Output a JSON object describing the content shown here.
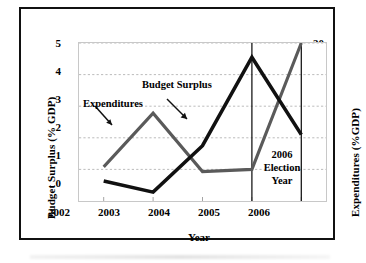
{
  "chart_data": {
    "type": "line",
    "title": "",
    "xlabel": "Year",
    "ylabel": "Budget Surplus (% GDP)",
    "y2label": "Expenditures (%GDP)",
    "categories": [
      "2002",
      "2003",
      "2004",
      "2005",
      "2006"
    ],
    "x_ticks": [
      "2002",
      "2003",
      "2004",
      "2005",
      "2006"
    ],
    "y_ticks": [
      "0",
      "1",
      "2",
      "3",
      "4",
      "5"
    ],
    "y2_ticks": [
      "25",
      "26",
      "27",
      "28",
      "29",
      "30"
    ],
    "ylim": [
      0,
      5
    ],
    "y2lim": [
      25,
      30
    ],
    "grid": true,
    "legend": "annotations",
    "series": [
      {
        "name": "Budget Surplus",
        "axis": "left",
        "unit": "% GDP",
        "color": "#111111",
        "values": [
          0.63,
          0.28,
          1.75,
          4.55,
          2.1
        ]
      },
      {
        "name": "Expenditures",
        "axis": "right",
        "unit": "%GDP",
        "color": "#5a5a5a",
        "values": [
          26.08,
          27.78,
          25.93,
          26.0,
          30.0
        ],
        "values_left_scale": [
          1.08,
          2.78,
          0.93,
          1.0,
          5.0
        ]
      }
    ],
    "annotations": [
      {
        "name": "expenditures-label",
        "text": "Expenditures",
        "points_to": "Expenditures"
      },
      {
        "name": "budget-surplus-label",
        "text": "Budget Surplus",
        "points_to": "Budget Surplus"
      },
      {
        "name": "election-year-note",
        "lines": [
          "2006",
          "Election",
          "Year"
        ],
        "text": "2006 Election Year"
      }
    ],
    "vertical_markers": [
      {
        "name": "election-line-2005",
        "x": "2005",
        "color": "#111111"
      },
      {
        "name": "election-line-2006",
        "x": "2006",
        "color": "#111111"
      }
    ]
  },
  "axes": {
    "left": {
      "title": "Budget Surplus (% GDP)",
      "ticks": [
        "5",
        "4",
        "3",
        "2",
        "1",
        "0"
      ]
    },
    "right": {
      "title": "Expenditures (%GDP)",
      "ticks": [
        "30",
        "29",
        "28",
        "27",
        "26",
        "25"
      ]
    },
    "bottom": {
      "title": "Year",
      "ticks": [
        "2002",
        "2003",
        "2004",
        "2005",
        "2006"
      ]
    }
  },
  "annotations": {
    "expenditures": "Expenditures",
    "budget_surplus": "Budget Surplus",
    "election_line1": "2006",
    "election_line2": "Election",
    "election_line3": "Year"
  },
  "colors": {
    "budget_surplus_line": "#111111",
    "expenditures_line": "#5a5a5a",
    "grid": "#b4b4b4",
    "plot_border": "#c8c8c8",
    "figure_border": "#111111",
    "background": "#ffffff"
  }
}
